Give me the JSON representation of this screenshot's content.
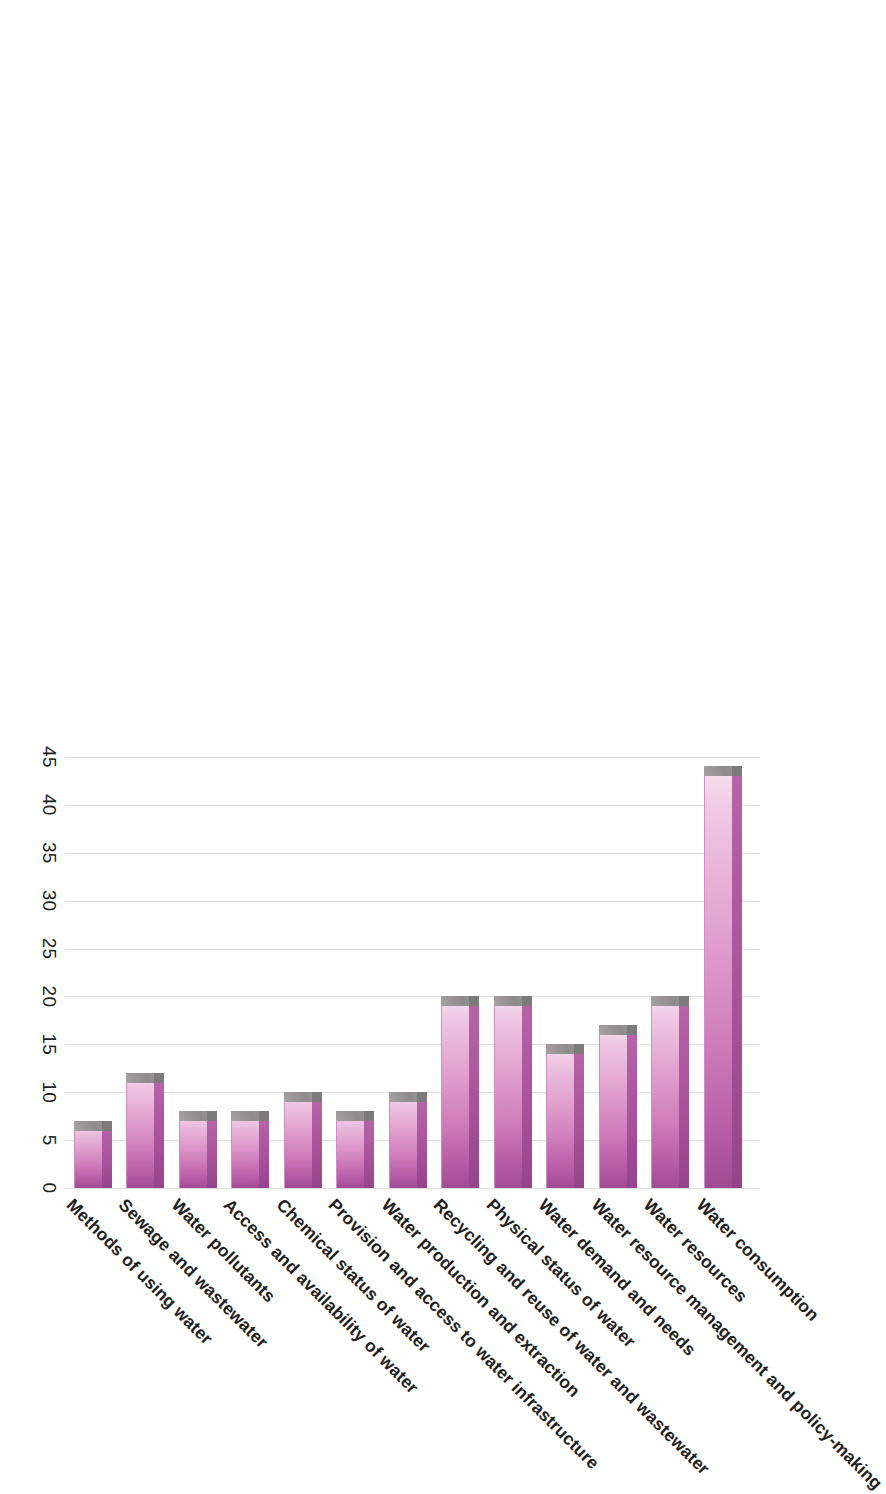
{
  "chart": {
    "type": "bar",
    "orientation": "horizontal",
    "page_rotation_degrees": 90
  },
  "axis": {
    "ticks": [
      "45",
      "40",
      "35",
      "30",
      "25",
      "20",
      "15",
      "10",
      "5",
      "0"
    ],
    "min": 0,
    "max": 45,
    "step": 5,
    "grid": true
  },
  "colors": {
    "bar_top": "#a8529b",
    "bar_front_light": "#f7e4f0",
    "bar_front_dark": "#a04b93",
    "bar_side": "#8e8b8d",
    "grid": "#d9d9d9",
    "text": "#231f20",
    "background": "#ffffff"
  },
  "chart_data": {
    "type": "bar",
    "title": "",
    "xlabel": "",
    "ylabel": "",
    "ylim": [
      0,
      45
    ],
    "grid": true,
    "legend": "none",
    "categories": [
      "Water consumption",
      "Water resources",
      "Water resource management and policy-making",
      "Water demand and needs",
      "Physical status of water",
      "Recycling and reuse of water and wastewater",
      "Water production and extraction",
      "Provision and access to water infrastructure",
      "Chemical status of water",
      "Access and availability of water",
      "Water pollutants",
      "Sewage and wastewater",
      "Methods of using water"
    ],
    "values": [
      44,
      20,
      17,
      15,
      20,
      20,
      10,
      8,
      10,
      8,
      8,
      12,
      7
    ]
  }
}
